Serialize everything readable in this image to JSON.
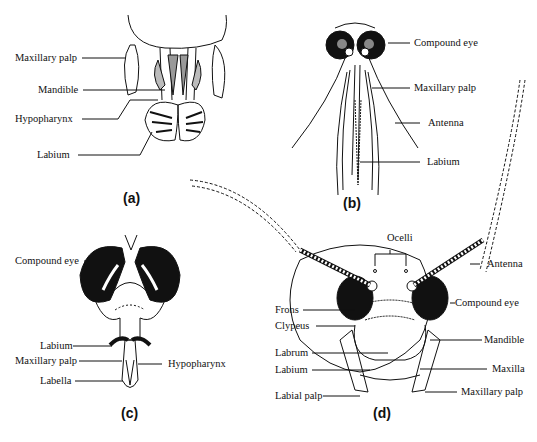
{
  "panels": {
    "a": {
      "caption": "(a)",
      "labels": [
        "Maxillary palp",
        "Mandible",
        "Hypopharynx",
        "Labium"
      ]
    },
    "b": {
      "caption": "(b)",
      "labels": [
        "Compound eye",
        "Maxillary palp",
        "Antenna",
        "Labium"
      ]
    },
    "c": {
      "caption": "(c)",
      "labels": [
        "Compound eye",
        "Labium",
        "Maxillary palp",
        "Labella",
        "Hypopharynx"
      ]
    },
    "d": {
      "caption": "(d)",
      "labels": [
        "Ocelli",
        "Antenna",
        "Compound eye",
        "Frons",
        "Clypeus",
        "Mandible",
        "Labrum",
        "Labium",
        "Maxilla",
        "Labial palp",
        "Maxillary palp"
      ]
    }
  }
}
